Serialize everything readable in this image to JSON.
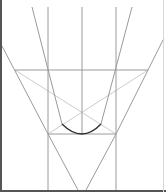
{
  "diagram": {
    "type": "geometric-construction",
    "caption": "",
    "colors": {
      "construction_line": "#9a9a9a",
      "faint_line": "#cccccc",
      "curve": "#333333",
      "frame": "#555555"
    },
    "lines": [
      {
        "id": "v-left",
        "x1": 48,
        "y1": 7,
        "x2": 48,
        "y2": 190
      },
      {
        "id": "v-center",
        "x1": 82,
        "y1": 7,
        "x2": 82,
        "y2": 134
      },
      {
        "id": "v-right",
        "x1": 116,
        "y1": 7,
        "x2": 116,
        "y2": 190
      },
      {
        "id": "d-top-left",
        "x1": 32,
        "y1": 7,
        "x2": 62,
        "y2": 124
      },
      {
        "id": "d-top-right",
        "x1": 132,
        "y1": 7,
        "x2": 101,
        "y2": 124
      },
      {
        "id": "d-outer-left",
        "x1": 2,
        "y1": 46,
        "x2": 48,
        "y2": 134
      },
      {
        "id": "d-outer-right",
        "x1": 164,
        "y1": 38,
        "x2": 116,
        "y2": 134
      },
      {
        "id": "h-upper",
        "x1": 15,
        "y1": 70,
        "x2": 148,
        "y2": 70
      },
      {
        "id": "h-lower",
        "x1": 48,
        "y1": 134,
        "x2": 116,
        "y2": 134
      },
      {
        "id": "d-bottom-left",
        "x1": 48,
        "y1": 134,
        "x2": 78,
        "y2": 190
      },
      {
        "id": "d-bottom-right",
        "x1": 116,
        "y1": 134,
        "x2": 86,
        "y2": 190
      }
    ],
    "faint_lines": [
      {
        "id": "x-left",
        "x1": 15,
        "y1": 70,
        "x2": 116,
        "y2": 134
      },
      {
        "id": "x-right",
        "x1": 148,
        "y1": 70,
        "x2": 48,
        "y2": 134
      }
    ],
    "curve": {
      "id": "arc",
      "x1": 62,
      "y1": 124,
      "cx": 82,
      "cy": 144,
      "x2": 101,
      "y2": 124
    }
  }
}
